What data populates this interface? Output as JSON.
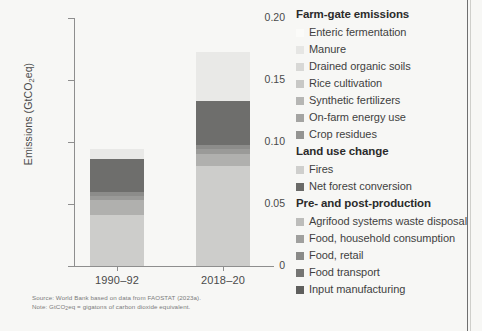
{
  "chart_data": {
    "type": "bar",
    "stacked": true,
    "title": "",
    "xlabel": "",
    "ylabel": "Emissions (GtCO2eq)",
    "ylim": [
      0,
      0.2
    ],
    "ytick_labels": [
      "0",
      "0.05",
      "0.10",
      "0.15",
      "0.20"
    ],
    "ytick_values": [
      0,
      0.05,
      0.1,
      0.15,
      0.2
    ],
    "grid": false,
    "legend_position": "right",
    "categories": [
      "1990–92",
      "2018–20"
    ],
    "series": [
      {
        "name": "Enteric fermentation",
        "group": "Farm-gate emissions",
        "color": "#f2f2f0",
        "values": [
          0.0,
          0.0
        ]
      },
      {
        "name": "Manure",
        "group": "Farm-gate emissions",
        "color": "#e4e4e2",
        "values": [
          0.0,
          0.0
        ]
      },
      {
        "name": "Drained organic soils",
        "group": "Farm-gate emissions",
        "color": "#d6d6d4",
        "values": [
          0.0,
          0.0
        ]
      },
      {
        "name": "Rice cultivation",
        "group": "Farm-gate emissions",
        "color": "#c6c6c4",
        "values": [
          0.0,
          0.0
        ]
      },
      {
        "name": "Synthetic fertilizers",
        "group": "Farm-gate emissions",
        "color": "#b4b4b2",
        "values": [
          0.0,
          0.0
        ]
      },
      {
        "name": "On-farm energy use",
        "group": "Farm-gate emissions",
        "color": "#a2a2a0",
        "values": [
          0.0,
          0.0
        ]
      },
      {
        "name": "Crop residues",
        "group": "Farm-gate emissions",
        "color": "#939391",
        "values": [
          0.0,
          0.0
        ]
      },
      {
        "name": "Fires",
        "group": "Land use change",
        "color": "#cfcfcd",
        "values": [
          0.0,
          0.0
        ]
      },
      {
        "name": "Net forest conversion",
        "group": "Land use change",
        "color": "#7a7a78",
        "values": [
          0.0,
          0.0
        ]
      },
      {
        "name": "Agrifood systems waste disposal",
        "group": "Pre- and post-production",
        "color": "#cdcdcb",
        "values": [
          0.0415,
          0.0805
        ]
      },
      {
        "name": "Food, household consumption",
        "group": "Pre- and post-production",
        "color": "#b0b0ae",
        "values": [
          0.0115,
          0.0095
        ]
      },
      {
        "name": "Food, retail",
        "group": "Pre- and post-production",
        "color": "#9a9a98",
        "values": [
          0.0035,
          0.0045
        ]
      },
      {
        "name": "Food transport",
        "group": "Pre- and post-production",
        "color": "#8c8c8a",
        "values": [
          0.003,
          0.0035
        ]
      },
      {
        "name": "Input manufacturing",
        "group": "Pre- and post-production",
        "color": "#6e6e6c",
        "values": [
          0.0265,
          0.035
        ]
      }
    ],
    "totals": [
      0.094,
      0.173
    ]
  },
  "axes": {
    "ylabel_prefix": "Emissions (GtCO",
    "ylabel_sub": "2",
    "ylabel_suffix": "eq)",
    "yticks": [
      {
        "label": "0.20",
        "value": 0.2
      },
      {
        "label": "0.15",
        "value": 0.15
      },
      {
        "label": "0.10",
        "value": 0.1
      },
      {
        "label": "0.05",
        "value": 0.05
      },
      {
        "label": "0",
        "value": 0.0
      }
    ],
    "xticks": [
      {
        "label": "1990–92"
      },
      {
        "label": "2018–20"
      }
    ]
  },
  "legend": {
    "groups": [
      {
        "title": "Farm-gate emissions",
        "items": [
          {
            "label": "Enteric fermentation",
            "color": "#fbfbf9"
          },
          {
            "label": "Manure",
            "color": "#e6e6e4"
          },
          {
            "label": "Drained organic soils",
            "color": "#d8d8d6"
          },
          {
            "label": "Rice cultivation",
            "color": "#c8c8c6"
          },
          {
            "label": "Synthetic fertilizers",
            "color": "#b6b6b4"
          },
          {
            "label": "On-farm energy use",
            "color": "#a4a4a2"
          },
          {
            "label": "Crop residues",
            "color": "#949492"
          }
        ]
      },
      {
        "title": "Land use change",
        "items": [
          {
            "label": "Fires",
            "color": "#cfcfcd"
          },
          {
            "label": "Net forest conversion",
            "color": "#6a6a68"
          }
        ]
      },
      {
        "title": "Pre- and post-production",
        "items": [
          {
            "label": "Agrifood systems waste disposal",
            "color": "#bdbdbb"
          },
          {
            "label": "Food, household consumption",
            "color": "#a0a09e"
          },
          {
            "label": "Food, retail",
            "color": "#8a8a88"
          },
          {
            "label": "Food transport",
            "color": "#757573"
          },
          {
            "label": "Input manufacturing",
            "color": "#5f5f5d"
          }
        ]
      }
    ]
  },
  "notes": {
    "source": "Source: World Bank based on data from FAOSTAT (2023a).",
    "note_prefix": "Note: GtCO",
    "note_sub": "2",
    "note_suffix": "eq = gigatons of carbon dioxide equivalent."
  }
}
